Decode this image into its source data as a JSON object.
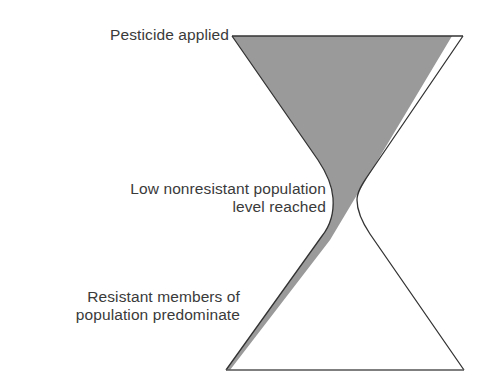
{
  "diagram": {
    "type": "hourglass",
    "labels": {
      "top": "Pesticide applied",
      "middle_line1": "Low nonresistant population",
      "middle_line2": "level reached",
      "bottom_line1": "Resistant members of",
      "bottom_line2": "population predominate"
    },
    "regions": [
      {
        "name": "nonresistant-population",
        "fill": "#9a9a9a",
        "description": "Gray area filling the upper bulb, narrowing through the neck"
      },
      {
        "name": "resistant-population",
        "fill": "#ffffff",
        "description": "White area that grows in the lower bulb"
      }
    ],
    "colors": {
      "outline": "#333333",
      "nonresistant_fill": "#9a9a9a",
      "background": "#ffffff",
      "text": "#3a3a3a"
    }
  }
}
